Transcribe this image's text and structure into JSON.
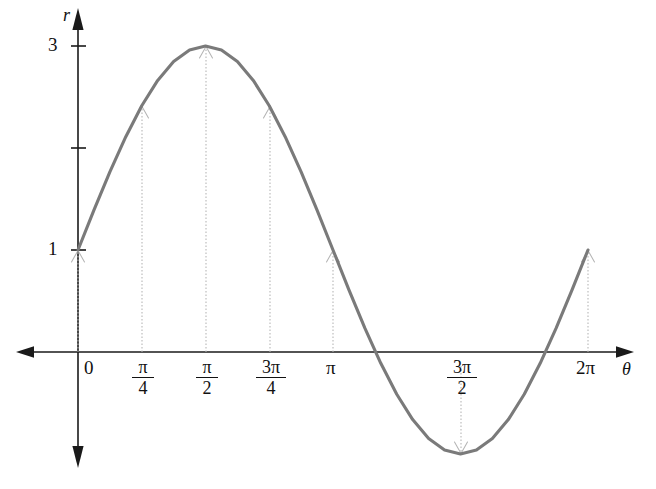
{
  "chart_data": {
    "type": "line",
    "title": "",
    "subtitle": "",
    "xlabel": "θ",
    "ylabel": "r",
    "equation": "r = 1 + 2 sin θ",
    "grid": false,
    "legend": false,
    "legend_position": "none",
    "xlim": [
      -0.35,
      6.9
    ],
    "ylim": [
      -1.45,
      3.45
    ],
    "axis_style": "cartesian-arrows-four-directions",
    "curve_color": "#7a7a7a",
    "axis_color": "#1a1a1a",
    "guide_color": "#b4b4b4",
    "x_ticks": [
      {
        "value": 0,
        "label": "0",
        "kind": "plain",
        "pixel_x": 78
      },
      {
        "value": 0.7853981634,
        "label": "π/4",
        "kind": "fraction",
        "numerator": "π",
        "denominator": "4",
        "pixel_x": 142
      },
      {
        "value": 1.5707963268,
        "label": "π/2",
        "kind": "fraction",
        "numerator": "π",
        "denominator": "2",
        "pixel_x": 206
      },
      {
        "value": 2.3561944902,
        "label": "3π/4",
        "kind": "fraction",
        "numerator": "3π",
        "denominator": "4",
        "pixel_x": 270
      },
      {
        "value": 3.1415926536,
        "label": "π",
        "kind": "plain",
        "pixel_x": 333
      },
      {
        "value": 4.7123889804,
        "label": "3π/2",
        "kind": "fraction",
        "numerator": "3π",
        "denominator": "2",
        "pixel_x": 461
      },
      {
        "value": 6.2831853072,
        "label": "2π",
        "kind": "plain",
        "pixel_x": 588
      }
    ],
    "y_ticks": [
      {
        "value": 1,
        "label": "1",
        "labeled": true
      },
      {
        "value": 2,
        "label": "",
        "labeled": false
      },
      {
        "value": 3,
        "label": "3",
        "labeled": true
      }
    ],
    "annotated_points": [
      {
        "theta_label": "0",
        "theta": 0,
        "r": 1,
        "arrow_direction": "up"
      },
      {
        "theta_label": "π/4",
        "theta": 0.7853981634,
        "r": 2.41,
        "arrow_direction": "up"
      },
      {
        "theta_label": "π/2",
        "theta": 1.5707963268,
        "r": 3,
        "arrow_direction": "up"
      },
      {
        "theta_label": "3π/4",
        "theta": 2.3561944902,
        "r": 2.41,
        "arrow_direction": "up"
      },
      {
        "theta_label": "π",
        "theta": 3.1415926536,
        "r": 1,
        "arrow_direction": "up"
      },
      {
        "theta_label": "3π/2",
        "theta": 4.7123889804,
        "r": -1,
        "arrow_direction": "down"
      },
      {
        "theta_label": "2π",
        "theta": 6.2831853072,
        "r": 1,
        "arrow_direction": "up"
      }
    ],
    "x": [
      0,
      0.1963,
      0.3927,
      0.589,
      0.7854,
      0.9817,
      1.1781,
      1.3744,
      1.5708,
      1.7671,
      1.9635,
      2.1598,
      2.3562,
      2.5525,
      2.7489,
      2.9452,
      3.1416,
      3.3379,
      3.5343,
      3.7306,
      3.927,
      4.1233,
      4.3197,
      4.516,
      4.7124,
      4.9087,
      5.1051,
      5.3014,
      5.4978,
      5.6941,
      5.8905,
      6.0868,
      6.2832
    ],
    "y": [
      1,
      1.3902,
      1.7654,
      2.1111,
      2.4142,
      2.6629,
      2.8478,
      2.9616,
      3,
      2.9616,
      2.8478,
      2.6629,
      2.4142,
      2.1111,
      1.7654,
      1.3902,
      1,
      0.6098,
      0.2346,
      -0.1111,
      -0.4142,
      -0.6629,
      -0.8478,
      -0.9616,
      -1,
      -0.9616,
      -0.8478,
      -0.6629,
      -0.4142,
      -0.1111,
      0.2346,
      0.6098,
      1
    ],
    "zero_crossings": [
      3.665,
      5.76
    ]
  }
}
